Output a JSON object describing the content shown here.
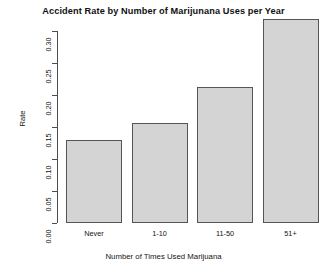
{
  "chart_data": {
    "type": "bar",
    "title": "Accident Rate by Number of Marijunana Uses per Year",
    "xlabel": "Number of Times Used Marijuana",
    "ylabel": "Rate",
    "categories": [
      "Never",
      "1-10",
      "11-50",
      "51+"
    ],
    "values": [
      0.13,
      0.156,
      0.213,
      0.318
    ],
    "ylim": [
      0.0,
      0.32
    ],
    "yticks": [
      0.0,
      0.05,
      0.1,
      0.15,
      0.2,
      0.25,
      0.3
    ],
    "ytick_labels": [
      "0.00",
      "0.05",
      "0.10",
      "0.15",
      "0.20",
      "0.25",
      "0.30"
    ],
    "grid": false,
    "legend": false,
    "bar_fill_color": "#d4d4d4",
    "bar_border_color": "#555555",
    "axis_color": "#4d4d4d",
    "background_color": "#ffffff"
  }
}
